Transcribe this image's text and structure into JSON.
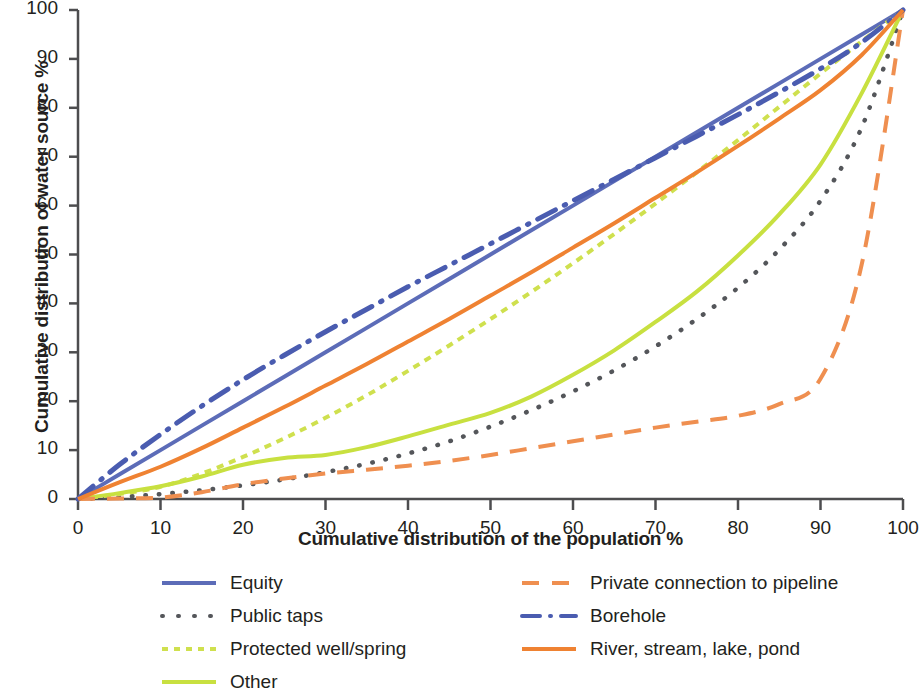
{
  "chart_data": {
    "type": "line",
    "title": "",
    "xlabel": "Cumulative distribution of the population %",
    "ylabel": "Cumulative distribution of water source %",
    "xlim": [
      0,
      100
    ],
    "ylim": [
      0,
      100
    ],
    "xticks": [
      "0",
      "10",
      "20",
      "30",
      "40",
      "50",
      "60",
      "70",
      "80",
      "90",
      "100"
    ],
    "yticks": [
      "0",
      "10",
      "20",
      "30",
      "40",
      "50",
      "60",
      "70",
      "80",
      "90",
      "100"
    ],
    "grid": false,
    "legend_position": "below",
    "x": [
      0,
      5,
      10,
      15,
      20,
      25,
      30,
      35,
      40,
      45,
      50,
      55,
      60,
      65,
      70,
      75,
      80,
      85,
      90,
      95,
      100
    ],
    "series": [
      {
        "name": "Equity",
        "color": "#5c6cb8",
        "style": "solid",
        "values": [
          0,
          5,
          10,
          15,
          20,
          25,
          30,
          35,
          40,
          45,
          50,
          55,
          60,
          65,
          70,
          75,
          80,
          85,
          90,
          95,
          100
        ]
      },
      {
        "name": "Public taps",
        "color": "#54565a",
        "style": "dotted",
        "values": [
          0,
          0.4,
          1.0,
          1.8,
          2.8,
          4.0,
          5.5,
          7.2,
          9.3,
          11.8,
          14.8,
          18.2,
          22.0,
          26.3,
          31.2,
          36.8,
          43.2,
          51.0,
          61.0,
          76.0,
          100
        ]
      },
      {
        "name": "Protected well/spring",
        "color": "#cfe04e",
        "style": "dashed-fine",
        "values": [
          0,
          1.0,
          2.5,
          5.2,
          8.6,
          12.4,
          16.6,
          21.2,
          26.2,
          31.4,
          36.8,
          42.4,
          48.2,
          54.2,
          60.4,
          66.8,
          73.4,
          80.2,
          87.0,
          93.6,
          100
        ]
      },
      {
        "name": "Other",
        "color": "#c8e040",
        "style": "solid",
        "values": [
          0,
          1.2,
          2.6,
          4.6,
          7.0,
          8.4,
          9.0,
          10.6,
          12.8,
          15.2,
          17.6,
          21.0,
          25.4,
          30.4,
          36.2,
          42.4,
          49.8,
          58.2,
          68.4,
          83.0,
          100
        ]
      },
      {
        "name": "Private connection to pipeline",
        "color": "#ef8f50",
        "style": "dashed",
        "values": [
          0,
          0.1,
          0.3,
          1.4,
          3.0,
          4.2,
          5.2,
          6.0,
          6.8,
          7.8,
          9.0,
          10.4,
          11.8,
          13.2,
          14.6,
          15.8,
          17.0,
          19.4,
          24.6,
          48.0,
          100
        ]
      },
      {
        "name": "Borehole",
        "color": "#4a5cb0",
        "style": "dash-dot",
        "values": [
          0,
          7.0,
          13.2,
          19.0,
          24.4,
          29.4,
          34.2,
          38.8,
          43.4,
          47.8,
          52.2,
          56.6,
          61.0,
          65.4,
          69.8,
          74.2,
          78.6,
          83.2,
          88.0,
          93.4,
          100
        ]
      },
      {
        "name": "River, stream, lake, pond",
        "color": "#ef8232",
        "style": "solid",
        "values": [
          0,
          3.4,
          6.6,
          10.4,
          14.6,
          18.8,
          23.2,
          27.6,
          32.2,
          36.8,
          41.6,
          46.4,
          51.4,
          56.4,
          61.6,
          66.8,
          72.2,
          77.8,
          83.6,
          90.8,
          100
        ]
      }
    ]
  },
  "legend": {
    "items": [
      {
        "label": "Equity",
        "key": "equity",
        "column": "left"
      },
      {
        "label": "Public taps",
        "key": "public-taps",
        "column": "left"
      },
      {
        "label": "Protected well/spring",
        "key": "protected-well-spring",
        "column": "left"
      },
      {
        "label": "Other",
        "key": "other",
        "column": "left"
      },
      {
        "label": "Private connection to pipeline",
        "key": "private-connection",
        "column": "right"
      },
      {
        "label": "Borehole",
        "key": "borehole",
        "column": "right"
      },
      {
        "label": "River, stream, lake, pond",
        "key": "river-stream-lake-pond",
        "column": "right"
      }
    ]
  },
  "axes": {
    "color": "#4d4d4f"
  }
}
